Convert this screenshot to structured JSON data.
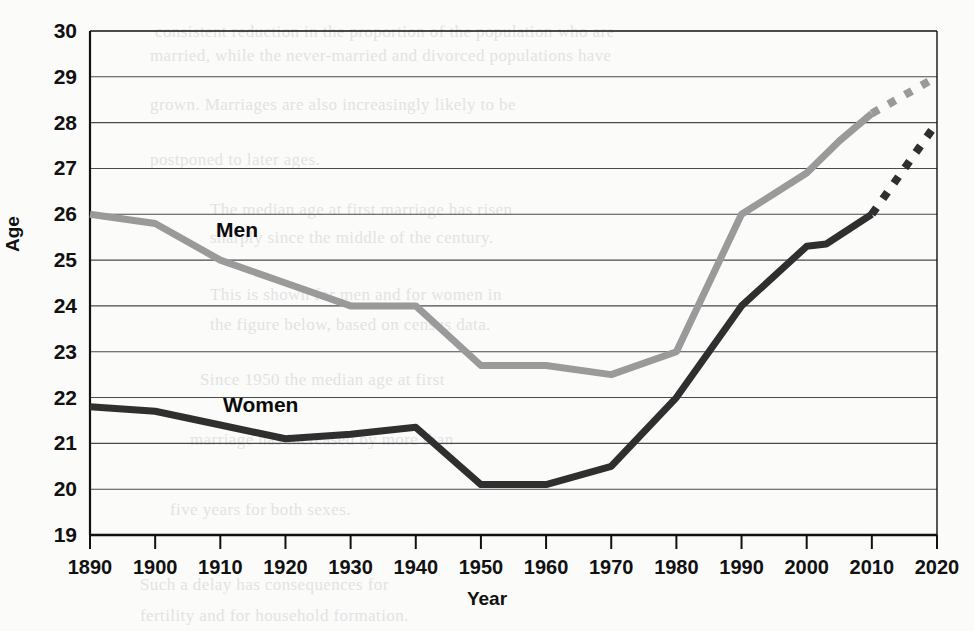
{
  "chart_data": {
    "type": "line",
    "title": "",
    "xlabel": "Year",
    "ylabel": "Age",
    "xlim": [
      1890,
      2020
    ],
    "ylim": [
      19,
      30
    ],
    "grid": true,
    "legend_position": "inline-annotation",
    "x": [
      1890,
      1900,
      1910,
      1920,
      1930,
      1940,
      1950,
      1960,
      1970,
      1980,
      1990,
      2000,
      2010,
      2020
    ],
    "xticks": [
      "1890",
      "1900",
      "1910",
      "1920",
      "1930",
      "1940",
      "1950",
      "1960",
      "1970",
      "1980",
      "1990",
      "2000",
      "2010",
      "2020"
    ],
    "yticks": [
      "19",
      "20",
      "21",
      "22",
      "23",
      "24",
      "25",
      "26",
      "27",
      "28",
      "29",
      "30"
    ],
    "series": [
      {
        "name": "Men",
        "color": "#9a9a9a",
        "label_text": "Men",
        "solid_points": [
          {
            "year": 1890,
            "age": 26.0
          },
          {
            "year": 1900,
            "age": 25.8
          },
          {
            "year": 1910,
            "age": 25.0
          },
          {
            "year": 1920,
            "age": 24.5
          },
          {
            "year": 1930,
            "age": 24.0
          },
          {
            "year": 1940,
            "age": 24.0
          },
          {
            "year": 1950,
            "age": 22.7
          },
          {
            "year": 1960,
            "age": 22.7
          },
          {
            "year": 1970,
            "age": 22.5
          },
          {
            "year": 1980,
            "age": 23.0
          },
          {
            "year": 1990,
            "age": 26.0
          },
          {
            "year": 2000,
            "age": 26.9
          },
          {
            "year": 2005,
            "age": 27.6
          },
          {
            "year": 2010,
            "age": 28.2
          }
        ],
        "dashed_points": [
          {
            "year": 2010,
            "age": 28.2
          },
          {
            "year": 2020,
            "age": 29.0
          }
        ]
      },
      {
        "name": "Women",
        "color": "#2f2f2f",
        "label_text": "Women",
        "solid_points": [
          {
            "year": 1890,
            "age": 21.8
          },
          {
            "year": 1900,
            "age": 21.7
          },
          {
            "year": 1910,
            "age": 21.4
          },
          {
            "year": 1920,
            "age": 21.1
          },
          {
            "year": 1930,
            "age": 21.2
          },
          {
            "year": 1940,
            "age": 21.35
          },
          {
            "year": 1950,
            "age": 20.1
          },
          {
            "year": 1960,
            "age": 20.1
          },
          {
            "year": 1970,
            "age": 20.5
          },
          {
            "year": 1980,
            "age": 22.0
          },
          {
            "year": 1990,
            "age": 24.0
          },
          {
            "year": 2000,
            "age": 25.3
          },
          {
            "year": 2003,
            "age": 25.35
          },
          {
            "year": 2010,
            "age": 26.0
          }
        ],
        "dashed_points": [
          {
            "year": 2010,
            "age": 26.0
          },
          {
            "year": 2020,
            "age": 28.0
          }
        ]
      }
    ]
  },
  "bleed_text": [
    {
      "x": 155,
      "y": 22,
      "text": "consistent reduction in the proportion of the population who are"
    },
    {
      "x": 150,
      "y": 46,
      "text": "married, while the never-married and divorced populations have"
    },
    {
      "x": 150,
      "y": 95,
      "text": "grown. Marriages are also increasingly likely to be"
    },
    {
      "x": 150,
      "y": 150,
      "text": "postponed to later ages."
    },
    {
      "x": 210,
      "y": 200,
      "text": "The median age at first marriage has risen"
    },
    {
      "x": 210,
      "y": 228,
      "text": "sharply since the middle of the century."
    },
    {
      "x": 210,
      "y": 285,
      "text": "This is shown for men and for women in"
    },
    {
      "x": 210,
      "y": 315,
      "text": "the figure below, based on census data."
    },
    {
      "x": 200,
      "y": 370,
      "text": "Since 1950 the median age at first"
    },
    {
      "x": 190,
      "y": 430,
      "text": "marriage has increased by more than"
    },
    {
      "x": 170,
      "y": 500,
      "text": "five years for both sexes."
    },
    {
      "x": 140,
      "y": 575,
      "text": "Such a delay has consequences for"
    },
    {
      "x": 140,
      "y": 606,
      "text": "fertility and for household formation."
    }
  ]
}
